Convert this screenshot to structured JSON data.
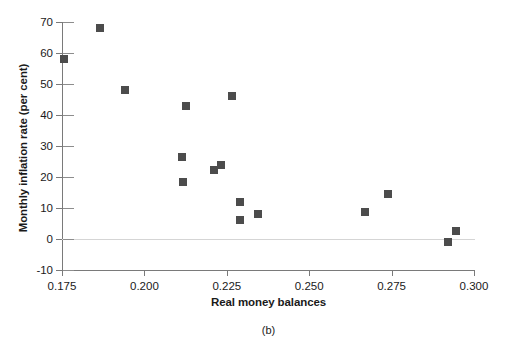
{
  "chart_data": {
    "type": "scatter",
    "title": "",
    "caption": "(b)",
    "xlabel": "Real money balances",
    "ylabel": "Monthly inflation rate (per cent)",
    "xlim": [
      0.175,
      0.3
    ],
    "ylim": [
      -10,
      70
    ],
    "xticks": [
      0.175,
      0.2,
      0.225,
      0.25,
      0.275,
      0.3
    ],
    "xtick_labels": [
      "0.175",
      "0.200",
      "0.225",
      "0.250",
      "0.275",
      "0.300"
    ],
    "yticks": [
      -10,
      0,
      10,
      20,
      30,
      40,
      50,
      60,
      70
    ],
    "ytick_labels": [
      "-10",
      "0",
      "10",
      "20",
      "30",
      "40",
      "50",
      "60",
      "70"
    ],
    "grid": false,
    "legend": false,
    "zero_line": true,
    "marker_shape": "square",
    "marker_color": "#4c4c4c",
    "axis_color": "#7a7a7a",
    "zero_line_color": "#d5d5d5",
    "points": [
      {
        "x": 0.1757,
        "y": 58.0
      },
      {
        "x": 0.1866,
        "y": 68.0
      },
      {
        "x": 0.1942,
        "y": 48.0
      },
      {
        "x": 0.2126,
        "y": 43.0
      },
      {
        "x": 0.2115,
        "y": 26.3
      },
      {
        "x": 0.2117,
        "y": 18.3
      },
      {
        "x": 0.221,
        "y": 22.3
      },
      {
        "x": 0.2231,
        "y": 24.0
      },
      {
        "x": 0.2267,
        "y": 46.0
      },
      {
        "x": 0.2289,
        "y": 12.0
      },
      {
        "x": 0.2291,
        "y": 6.2
      },
      {
        "x": 0.2346,
        "y": 8.2
      },
      {
        "x": 0.2668,
        "y": 8.6
      },
      {
        "x": 0.274,
        "y": 14.4
      },
      {
        "x": 0.2921,
        "y": -1.0
      },
      {
        "x": 0.2945,
        "y": 2.5
      }
    ]
  }
}
